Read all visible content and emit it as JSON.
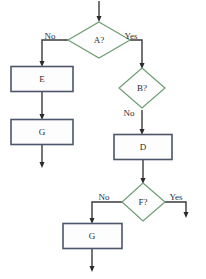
{
  "diagram": {
    "type": "flowchart",
    "title": "",
    "canvas": {
      "width": 206,
      "height": 279,
      "background": "#ffffff"
    },
    "colors": {
      "process_border": "#4c5668",
      "decision_border": "#6f9d74",
      "connector": "#3a3a3a",
      "label_text": "#2d2d2d",
      "shape_fill": "#fdfdfd"
    },
    "nodes": [
      {
        "id": "A",
        "shape": "decision",
        "label": "A?",
        "cx": 99,
        "cy": 40
      },
      {
        "id": "E",
        "shape": "process",
        "label": "E",
        "cx": 42,
        "cy": 79
      },
      {
        "id": "G1",
        "shape": "process",
        "label": "G",
        "cx": 42,
        "cy": 132
      },
      {
        "id": "B",
        "shape": "decision",
        "label": "B?",
        "cx": 142,
        "cy": 88
      },
      {
        "id": "D",
        "shape": "process",
        "label": "D",
        "cx": 143,
        "cy": 147
      },
      {
        "id": "F",
        "shape": "decision",
        "label": "F?",
        "cx": 143,
        "cy": 202
      },
      {
        "id": "G2",
        "shape": "process",
        "label": "G",
        "cx": 92,
        "cy": 236
      }
    ],
    "edge_labels": [
      {
        "id": "a-no",
        "text": "No",
        "x": 50,
        "y": 37
      },
      {
        "id": "a-yes",
        "text": "Yes",
        "x": 131,
        "y": 37
      },
      {
        "id": "b-no",
        "text": "No",
        "x": 129,
        "y": 113
      },
      {
        "id": "f-no",
        "text": "No",
        "x": 104,
        "y": 198
      },
      {
        "id": "f-yes",
        "text": "Yes",
        "x": 175,
        "y": 198
      }
    ],
    "edges": [
      {
        "from": "start",
        "to": "A",
        "label": ""
      },
      {
        "from": "A",
        "to": "E",
        "label": "No"
      },
      {
        "from": "A",
        "to": "B",
        "label": "Yes"
      },
      {
        "from": "E",
        "to": "G1",
        "label": ""
      },
      {
        "from": "G1",
        "to": "end-left",
        "label": ""
      },
      {
        "from": "B",
        "to": "D",
        "label": "No"
      },
      {
        "from": "D",
        "to": "F",
        "label": ""
      },
      {
        "from": "F",
        "to": "G2",
        "label": "No"
      },
      {
        "from": "F",
        "to": "end-right",
        "label": "Yes"
      },
      {
        "from": "G2",
        "to": "end-bottom",
        "label": ""
      }
    ]
  }
}
